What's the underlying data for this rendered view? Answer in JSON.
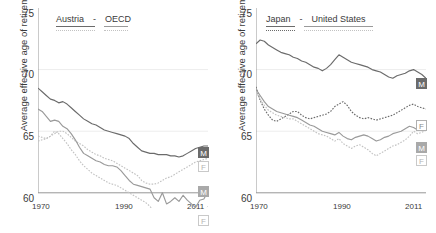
{
  "figure": {
    "ylabel": "Average effective age of retirement",
    "yticks": [
      "60",
      "65",
      "70",
      "75"
    ],
    "xticks": [
      "1970",
      "1990",
      "2011"
    ]
  },
  "colors": {
    "dark": "#6b6b6b",
    "mid": "#9a9a9a",
    "light": "#c2c2c2",
    "axis": "#8a8a8a",
    "grid": "#ededed",
    "text": "#3a3a3a"
  },
  "panels": [
    {
      "id": "austria-oecd",
      "legend": {
        "series_a": "Austria",
        "separator": "-",
        "series_b": "United States placeholder",
        "label_b": "OECD"
      },
      "badges": [
        {
          "text": "M",
          "style": "dark"
        },
        {
          "text": "F",
          "style": "light"
        },
        {
          "text": "M",
          "style": "mid"
        },
        {
          "text": "F",
          "style": "light"
        }
      ]
    },
    {
      "id": "japan-unitedstates",
      "legend": {
        "series_a": "Japan",
        "separator": "-",
        "label_b": "United States"
      },
      "badges": [
        {
          "text": "M",
          "style": "dark"
        },
        {
          "text": "F",
          "style": "outline"
        },
        {
          "text": "M",
          "style": "mid"
        },
        {
          "text": "F",
          "style": "light"
        }
      ]
    }
  ],
  "chart_data": {
    "type": "line",
    "title": "",
    "xlabel": "",
    "ylabel": "Average effective age of retirement",
    "xlim": [
      1970,
      2011
    ],
    "ylim": [
      60,
      75
    ],
    "ytick_values": [
      60,
      65,
      70,
      75
    ],
    "xtick_values": [
      1970,
      1990,
      2011
    ],
    "grid": "horizontal",
    "legend_position": "top-left-inside",
    "panels": [
      {
        "name": "Austria - OECD",
        "series": [
          {
            "name": "Austria Men",
            "label": "M",
            "style": "solid",
            "color": "#6b6b6b",
            "x": [
              1970,
              1971,
              1972,
              1973,
              1974,
              1975,
              1976,
              1977,
              1978,
              1979,
              1980,
              1981,
              1982,
              1983,
              1984,
              1985,
              1986,
              1987,
              1988,
              1989,
              1990,
              1991,
              1992,
              1993,
              1994,
              1995,
              1996,
              1997,
              1998,
              1999,
              2000,
              2001,
              2002,
              2003,
              2004,
              2005,
              2006,
              2007,
              2008,
              2009,
              2010,
              2011
            ],
            "y": [
              68.5,
              68.2,
              67.9,
              67.6,
              67.5,
              67.3,
              67.4,
              67.2,
              66.9,
              66.6,
              66.3,
              66.0,
              65.8,
              65.6,
              65.5,
              65.3,
              65.1,
              65.0,
              64.9,
              64.8,
              64.7,
              64.6,
              64.4,
              64.0,
              63.7,
              63.4,
              63.3,
              63.2,
              63.2,
              63.1,
              63.1,
              63.1,
              63.0,
              63.0,
              62.9,
              63.0,
              63.2,
              63.4,
              63.6,
              63.7,
              63.8,
              63.8
            ]
          },
          {
            "name": "Austria Women",
            "label": "F",
            "style": "dotted",
            "color": "#c2c2c2",
            "x": [
              1970,
              1971,
              1972,
              1973,
              1974,
              1975,
              1976,
              1977,
              1978,
              1979,
              1980,
              1981,
              1982,
              1983,
              1984,
              1985,
              1986,
              1987,
              1988,
              1989,
              1990,
              1991,
              1992,
              1993,
              1994,
              1995,
              1996,
              1997,
              1998,
              1999,
              2000,
              2001,
              2002,
              2003,
              2004,
              2005,
              2006,
              2007,
              2008,
              2009,
              2010,
              2011
            ],
            "y": [
              64.2,
              64.3,
              64.4,
              64.6,
              64.8,
              65.0,
              65.0,
              64.8,
              64.5,
              64.2,
              64.0,
              63.8,
              63.5,
              63.3,
              63.1,
              63.0,
              62.8,
              62.7,
              62.6,
              62.4,
              62.2,
              62.0,
              61.8,
              61.6,
              61.4,
              61.0,
              60.8,
              60.7,
              60.7,
              60.8,
              61.0,
              61.2,
              61.3,
              61.5,
              61.7,
              61.9,
              62.1,
              62.3,
              62.5,
              62.6,
              62.7,
              62.8
            ]
          },
          {
            "name": "OECD Men",
            "label": "M",
            "style": "solid",
            "color": "#9a9a9a",
            "x": [
              1970,
              1971,
              1972,
              1973,
              1974,
              1975,
              1976,
              1977,
              1978,
              1979,
              1980,
              1981,
              1982,
              1983,
              1984,
              1985,
              1986,
              1987,
              1988,
              1989,
              1990,
              1991,
              1992,
              1993,
              1994,
              1995,
              1996,
              1997,
              1998,
              1999,
              2000,
              2001,
              2002,
              2003,
              2004,
              2005,
              2006,
              2007,
              2008,
              2009,
              2010,
              2011
            ],
            "y": [
              66.8,
              66.6,
              66.2,
              65.8,
              65.9,
              65.8,
              65.4,
              65.2,
              64.8,
              64.3,
              63.7,
              63.2,
              63.0,
              62.8,
              62.6,
              62.5,
              62.3,
              62.2,
              62.2,
              62.1,
              61.8,
              61.4,
              61.0,
              60.7,
              60.6,
              60.5,
              60.4,
              60.3,
              59.6,
              59.3,
              60.0,
              59.1,
              59.3,
              59.6,
              59.3,
              59.8,
              59.4,
              59.1,
              58.8,
              59.4,
              59.5,
              60.1
            ]
          },
          {
            "name": "OECD Women",
            "label": "F",
            "style": "dotted",
            "color": "#c2c2c2",
            "x": [
              1970,
              1971,
              1972,
              1973,
              1974,
              1975,
              1976,
              1977,
              1978,
              1979,
              1980,
              1981,
              1982,
              1983,
              1984,
              1985,
              1986,
              1987,
              1988,
              1989,
              1990,
              1991,
              1992,
              1993,
              1994,
              1995,
              1996,
              1997,
              1998,
              1999,
              2000,
              2001,
              2002,
              2003,
              2004,
              2005,
              2006,
              2007,
              2008,
              2009,
              2010,
              2011
            ],
            "y": [
              64.6,
              64.5,
              64.4,
              64.6,
              65.0,
              64.8,
              64.4,
              64.0,
              63.5,
              63.1,
              62.6,
              62.2,
              61.9,
              61.6,
              61.4,
              61.2,
              61.0,
              60.8,
              60.7,
              60.6,
              60.4,
              60.2,
              60.0,
              59.8,
              59.6,
              59.4,
              59.2,
              58.9,
              58.5,
              58.3,
              58.6,
              58.2,
              58.4,
              58.5,
              58.3,
              58.5,
              58.2,
              58.0,
              57.8,
              58.2,
              58.4,
              58.9
            ]
          }
        ]
      },
      {
        "name": "Japan - United States",
        "series": [
          {
            "name": "Japan Men",
            "label": "M",
            "style": "solid",
            "color": "#6b6b6b",
            "x": [
              1970,
              1971,
              1972,
              1973,
              1974,
              1975,
              1976,
              1977,
              1978,
              1979,
              1980,
              1981,
              1982,
              1983,
              1984,
              1985,
              1986,
              1987,
              1988,
              1989,
              1990,
              1991,
              1992,
              1993,
              1994,
              1995,
              1996,
              1997,
              1998,
              1999,
              2000,
              2001,
              2002,
              2003,
              2004,
              2005,
              2006,
              2007,
              2008,
              2009,
              2010,
              2011
            ],
            "y": [
              72.1,
              72.4,
              72.3,
              72.0,
              71.8,
              71.6,
              71.4,
              71.3,
              71.2,
              71.0,
              70.9,
              70.7,
              70.6,
              70.4,
              70.2,
              70.1,
              69.9,
              70.1,
              70.4,
              70.8,
              71.2,
              71.0,
              70.8,
              70.6,
              70.5,
              70.4,
              70.3,
              70.2,
              70.0,
              69.9,
              69.8,
              69.6,
              69.4,
              69.3,
              69.5,
              69.6,
              69.7,
              69.9,
              70.0,
              69.8,
              69.6,
              69.3
            ]
          },
          {
            "name": "Japan Women",
            "label": "F",
            "style": "dotted",
            "color": "#6b6b6b",
            "x": [
              1970,
              1971,
              1972,
              1973,
              1974,
              1975,
              1976,
              1977,
              1978,
              1979,
              1980,
              1981,
              1982,
              1983,
              1984,
              1985,
              1986,
              1987,
              1988,
              1989,
              1990,
              1991,
              1992,
              1993,
              1994,
              1995,
              1996,
              1997,
              1998,
              1999,
              2000,
              2001,
              2002,
              2003,
              2004,
              2005,
              2006,
              2007,
              2008,
              2009,
              2010,
              2011
            ],
            "y": [
              68.6,
              67.5,
              66.8,
              66.3,
              65.9,
              65.8,
              66.0,
              66.2,
              66.4,
              66.6,
              66.6,
              66.3,
              66.1,
              66.0,
              66.1,
              66.2,
              66.3,
              66.4,
              66.6,
              67.0,
              67.2,
              67.4,
              67.1,
              66.6,
              66.3,
              66.1,
              66.0,
              66.1,
              66.0,
              65.9,
              66.0,
              66.1,
              66.2,
              66.3,
              66.5,
              66.7,
              66.9,
              67.1,
              67.2,
              67.0,
              66.9,
              66.8
            ]
          },
          {
            "name": "United States Men",
            "label": "M",
            "style": "solid",
            "color": "#9a9a9a",
            "x": [
              1970,
              1971,
              1972,
              1973,
              1974,
              1975,
              1976,
              1977,
              1978,
              1979,
              1980,
              1981,
              1982,
              1983,
              1984,
              1985,
              1986,
              1987,
              1988,
              1989,
              1990,
              1991,
              1992,
              1993,
              1994,
              1995,
              1996,
              1997,
              1998,
              1999,
              2000,
              2001,
              2002,
              2003,
              2004,
              2005,
              2006,
              2007,
              2008,
              2009,
              2010,
              2011
            ],
            "y": [
              68.4,
              67.9,
              67.4,
              67.0,
              66.8,
              66.6,
              66.5,
              66.4,
              66.3,
              66.2,
              66.1,
              65.9,
              65.7,
              65.5,
              65.4,
              65.2,
              65.0,
              64.9,
              64.8,
              64.7,
              64.9,
              64.6,
              64.4,
              64.3,
              64.5,
              64.6,
              64.7,
              64.6,
              64.4,
              64.2,
              64.3,
              64.5,
              64.6,
              64.8,
              64.9,
              65.0,
              65.2,
              65.4,
              65.3,
              65.1,
              65.2,
              65.3
            ]
          },
          {
            "name": "United States Women",
            "label": "F",
            "style": "dotted",
            "color": "#c2c2c2",
            "x": [
              1970,
              1971,
              1972,
              1973,
              1974,
              1975,
              1976,
              1977,
              1978,
              1979,
              1980,
              1981,
              1982,
              1983,
              1984,
              1985,
              1986,
              1987,
              1988,
              1989,
              1990,
              1991,
              1992,
              1993,
              1994,
              1995,
              1996,
              1997,
              1998,
              1999,
              2000,
              2001,
              2002,
              2003,
              2004,
              2005,
              2006,
              2007,
              2008,
              2009,
              2010,
              2011
            ],
            "y": [
              68.2,
              67.6,
              67.1,
              66.7,
              66.5,
              66.3,
              66.2,
              66.1,
              66.0,
              66.0,
              65.8,
              65.6,
              65.4,
              65.2,
              65.0,
              64.8,
              64.7,
              64.6,
              64.4,
              64.2,
              64.4,
              64.0,
              63.8,
              63.6,
              63.8,
              63.9,
              63.7,
              63.5,
              63.2,
              63.0,
              63.2,
              63.4,
              63.6,
              63.8,
              63.9,
              64.1,
              64.3,
              64.6,
              65.0,
              64.8,
              64.9,
              65.1
            ]
          }
        ]
      }
    ]
  }
}
